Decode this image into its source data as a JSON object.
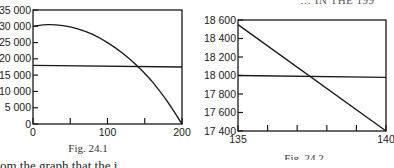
{
  "header_fragment": "… IN THE 199",
  "body_text_fragment": "om the graph that the i",
  "chart_data": [
    {
      "type": "line",
      "title": "",
      "caption": "Fig. 24.1",
      "xlabel": "",
      "ylabel": "",
      "xlim": [
        0,
        200
      ],
      "ylim": [
        0,
        35000
      ],
      "x_ticks": [
        0,
        50,
        100,
        150,
        200
      ],
      "x_tick_labels": [
        "0",
        "",
        "100",
        "",
        "200"
      ],
      "y_ticks": [
        0,
        5000,
        10000,
        15000,
        20000,
        25000,
        30000,
        35000
      ],
      "y_tick_labels": [
        "0",
        "5 000",
        "10 000",
        "15 000",
        "20 000",
        "25 000",
        "30 000",
        "35 000"
      ],
      "grid": false,
      "legend": null,
      "series": [
        {
          "name": "curve",
          "x": [
            0,
            20,
            40,
            60,
            80,
            100,
            120,
            140,
            160,
            180,
            200
          ],
          "values": [
            30000,
            30500,
            30200,
            29200,
            27500,
            25000,
            21800,
            17800,
            13000,
            7000,
            0
          ]
        },
        {
          "name": "horizontal line",
          "x": [
            0,
            200
          ],
          "values": [
            18000,
            17500
          ]
        }
      ]
    },
    {
      "type": "line",
      "title": "",
      "caption": "Fig. 24.2",
      "xlabel": "",
      "ylabel": "",
      "xlim": [
        135,
        140
      ],
      "ylim": [
        17400,
        18600
      ],
      "x_ticks": [
        135,
        136,
        137,
        138,
        139,
        140
      ],
      "x_tick_labels": [
        "135",
        "",
        "",
        "",
        "",
        "140"
      ],
      "y_ticks": [
        17400,
        17600,
        17800,
        18000,
        18200,
        18400,
        18600
      ],
      "y_tick_labels": [
        "17 400",
        "17 600",
        "17 800",
        "18 000",
        "18 200",
        "18 400",
        "18 600"
      ],
      "grid": false,
      "legend": null,
      "series": [
        {
          "name": "descending line",
          "x": [
            135,
            140
          ],
          "values": [
            18550,
            17400
          ]
        },
        {
          "name": "horizontal line",
          "x": [
            135,
            140
          ],
          "values": [
            18000,
            17980
          ]
        }
      ]
    }
  ]
}
